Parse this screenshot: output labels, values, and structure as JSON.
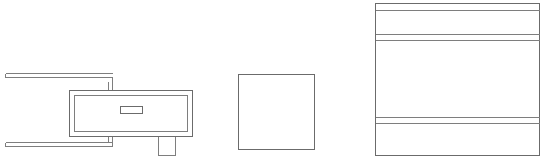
{
  "drawing": {
    "title": "Cabinet Elevation Line Drawing",
    "canvas": {
      "width": 545,
      "height": 168,
      "background": "#ffffff"
    },
    "stroke_color": "#7e7e7e",
    "stroke_color_dark": "#6b6b6b",
    "stroke_width": 1,
    "components": [
      {
        "name": "drawer-unit-assembly",
        "label": "Drawer unit with extension slide rails",
        "parts": [
          {
            "name": "upper-slide-rail",
            "type": "rail",
            "x1": 5,
            "y1": 77,
            "x2": 112,
            "y2": 77,
            "thickness": 4
          },
          {
            "name": "upper-rail-end-drop",
            "type": "vertical-segment",
            "x": 112,
            "y1": 77,
            "y2": 92
          },
          {
            "name": "lower-slide-rail",
            "type": "rail",
            "x1": 5,
            "y1": 146,
            "x2": 112,
            "y2": 146,
            "thickness": 4
          },
          {
            "name": "lower-rail-end-riser",
            "type": "vertical-segment",
            "x": 112,
            "y1": 132,
            "y2": 146
          },
          {
            "name": "drawer-box-outer",
            "type": "rect",
            "x": 69,
            "y": 90,
            "width": 123,
            "height": 46
          },
          {
            "name": "drawer-box-inner",
            "type": "rect",
            "x": 74,
            "y": 95,
            "width": 113,
            "height": 36
          },
          {
            "name": "drawer-handle",
            "type": "rect",
            "x": 120,
            "y": 106,
            "width": 22,
            "height": 7
          },
          {
            "name": "drawer-leg",
            "type": "rect",
            "x": 158,
            "y": 136,
            "width": 17,
            "height": 19
          }
        ]
      },
      {
        "name": "square-panel",
        "label": "Plain square panel",
        "parts": [
          {
            "name": "square-panel-outline",
            "type": "rect",
            "x": 238,
            "y": 74,
            "width": 76,
            "height": 75
          }
        ]
      },
      {
        "name": "tall-cabinet",
        "label": "Tall paneled cabinet",
        "parts": [
          {
            "name": "tall-cabinet-outline",
            "type": "rect",
            "x": 375,
            "y": 3,
            "width": 164,
            "height": 152
          },
          {
            "name": "cabinet-divider-upper-1",
            "type": "horizontal-line",
            "x1": 375,
            "x2": 539,
            "y": 10
          },
          {
            "name": "cabinet-divider-upper-2",
            "type": "horizontal-line",
            "x1": 375,
            "x2": 539,
            "y": 34
          },
          {
            "name": "cabinet-divider-upper-3",
            "type": "horizontal-line",
            "x1": 375,
            "x2": 539,
            "y": 40
          },
          {
            "name": "cabinet-divider-lower-1",
            "type": "horizontal-line",
            "x1": 375,
            "x2": 539,
            "y": 117
          },
          {
            "name": "cabinet-divider-lower-2",
            "type": "horizontal-line",
            "x1": 375,
            "x2": 539,
            "y": 123
          }
        ]
      }
    ]
  }
}
